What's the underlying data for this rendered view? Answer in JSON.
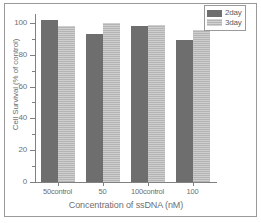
{
  "chart_data": {
    "type": "bar",
    "title": "",
    "xlabel": "Concentration of ssDNA (nM)",
    "ylabel": "Cell Survival (% of control)",
    "categories": [
      "50control",
      "50",
      "100control",
      "100"
    ],
    "series": [
      {
        "name": "2day",
        "color": "#6e6e6e",
        "values": [
          102,
          93,
          98,
          89
        ]
      },
      {
        "name": "3day",
        "color": "#b4b4b4",
        "values": [
          98,
          100,
          98.5,
          95.5
        ]
      }
    ],
    "ylim": [
      0,
      105
    ],
    "yticks": [
      0,
      20,
      40,
      60,
      80,
      100
    ],
    "ytick_labels": [
      "0",
      "20",
      "40",
      "60",
      "80",
      "100"
    ],
    "yminor_ticks": [
      10,
      30,
      50,
      70,
      90
    ],
    "grid": false,
    "legend_position": "top-right"
  },
  "legend": {
    "entries": [
      {
        "label": "2day"
      },
      {
        "label": "3day"
      }
    ]
  },
  "axes": {
    "x_title": "Concentration of ssDNA (nM)",
    "y_title": "Cell Survival (% of control)"
  }
}
